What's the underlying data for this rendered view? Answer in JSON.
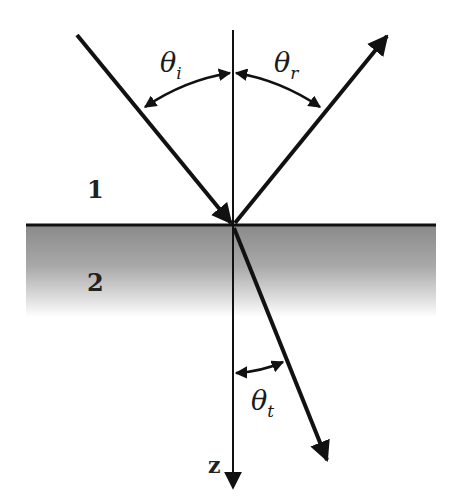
{
  "diagram": {
    "media": {
      "upper": {
        "label": "1"
      },
      "lower": {
        "label": "2",
        "shade_color": "#8a8a8a"
      }
    },
    "axis": {
      "label": "z"
    },
    "angles": {
      "incident": {
        "symbol": "θ",
        "subscript": "i"
      },
      "reflected": {
        "symbol": "θ",
        "subscript": "r"
      },
      "transmitted": {
        "symbol": "θ",
        "subscript": "t"
      }
    },
    "rays": [
      {
        "name": "incident",
        "from": [
          77,
          35
        ],
        "to": [
          233,
          225
        ]
      },
      {
        "name": "reflected",
        "from": [
          233,
          225
        ],
        "to": [
          388,
          35
        ]
      },
      {
        "name": "transmitted",
        "from": [
          233,
          225
        ],
        "to": [
          328,
          460
        ]
      }
    ],
    "colors": {
      "stroke": "#111111",
      "background": "#ffffff"
    }
  }
}
